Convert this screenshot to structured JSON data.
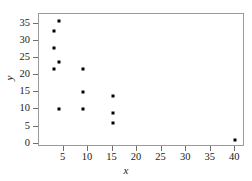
{
  "chart_data": {
    "type": "scatter",
    "title": "",
    "xlabel": "x",
    "ylabel": "y",
    "xlim": [
      0,
      42
    ],
    "ylim": [
      -1,
      38
    ],
    "grid": false,
    "legend": null,
    "x_ticks": [
      5,
      10,
      15,
      20,
      25,
      30,
      35,
      40
    ],
    "y_ticks": [
      0,
      5,
      10,
      15,
      20,
      25,
      30,
      35
    ],
    "x_tick_labels": [
      "5",
      "10",
      "15",
      "20",
      "25",
      "30",
      "35",
      "40"
    ],
    "y_tick_labels": [
      "0",
      "5",
      "10",
      "15",
      "20",
      "25",
      "30",
      "35"
    ],
    "marker": "square",
    "marker_color": "#000000",
    "points": [
      {
        "x": 4,
        "y": 36
      },
      {
        "x": 3,
        "y": 33
      },
      {
        "x": 3,
        "y": 28
      },
      {
        "x": 4,
        "y": 24
      },
      {
        "x": 3,
        "y": 22
      },
      {
        "x": 4,
        "y": 10
      },
      {
        "x": 9,
        "y": 22
      },
      {
        "x": 9,
        "y": 15
      },
      {
        "x": 9,
        "y": 10
      },
      {
        "x": 15,
        "y": 14
      },
      {
        "x": 15,
        "y": 9
      },
      {
        "x": 15,
        "y": 6
      },
      {
        "x": 40,
        "y": 1
      }
    ]
  },
  "style": {
    "frame_color": "#9a9a9a",
    "tick_color": "#6f6f6f",
    "text_color": "#1a1a1a",
    "background": "#ffffff"
  }
}
